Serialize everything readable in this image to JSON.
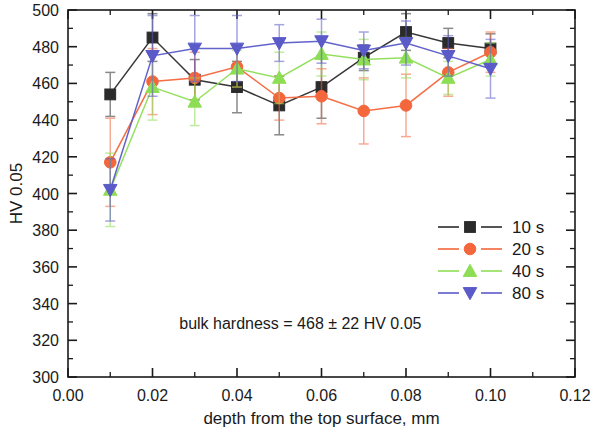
{
  "chart_data": {
    "type": "line",
    "title": "",
    "xlabel": "depth from the top surface, mm",
    "ylabel": "HV 0.05",
    "xlim": [
      0.0,
      0.12
    ],
    "ylim": [
      300,
      500
    ],
    "xticks": [
      0.0,
      0.02,
      0.04,
      0.06,
      0.08,
      0.1,
      0.12
    ],
    "xtick_labels": [
      "0.00",
      "0.02",
      "0.04",
      "0.06",
      "0.08",
      "0.10",
      "0.12"
    ],
    "yticks": [
      300,
      320,
      340,
      360,
      380,
      400,
      420,
      440,
      460,
      480,
      500
    ],
    "ytick_labels": [
      "300",
      "320",
      "340",
      "360",
      "380",
      "400",
      "420",
      "440",
      "460",
      "480",
      "500"
    ],
    "minor_ticks": true,
    "grid": false,
    "legend_position": "right-middle",
    "x": [
      0.01,
      0.02,
      0.03,
      0.04,
      0.05,
      0.06,
      0.07,
      0.08,
      0.09,
      0.1
    ],
    "series": [
      {
        "name": "10 s",
        "label": "10 s",
        "color": "#2b2b2b",
        "marker": "square",
        "values": [
          454,
          485,
          462,
          458,
          448,
          458,
          474,
          488,
          482,
          479
        ],
        "err_plus": [
          12,
          13,
          11,
          14,
          16,
          17,
          7,
          10,
          8,
          8
        ],
        "err_minus": [
          12,
          13,
          11,
          14,
          16,
          17,
          7,
          10,
          8,
          8
        ]
      },
      {
        "name": "20 s",
        "label": "20 s",
        "color": "#f4663c",
        "marker": "circle",
        "values": [
          417,
          461,
          463,
          469,
          452,
          453,
          445,
          448,
          466,
          477
        ],
        "err_plus": [
          24,
          18,
          14,
          11,
          12,
          15,
          18,
          17,
          13,
          11
        ],
        "err_minus": [
          24,
          18,
          14,
          11,
          12,
          15,
          18,
          17,
          13,
          11
        ]
      },
      {
        "name": "40 s",
        "label": "40 s",
        "color": "#8ede55",
        "marker": "triangle-up",
        "values": [
          402,
          458,
          450,
          468,
          463,
          476,
          473,
          474,
          463,
          473
        ],
        "err_plus": [
          20,
          18,
          13,
          10,
          14,
          12,
          11,
          11,
          9,
          9
        ],
        "err_minus": [
          20,
          18,
          13,
          10,
          14,
          12,
          11,
          11,
          9,
          9
        ]
      },
      {
        "name": "80 s",
        "label": "80 s",
        "color": "#5a5ac8",
        "marker": "triangle-down",
        "values": [
          402,
          475,
          479,
          479,
          482,
          483,
          478,
          482,
          475,
          468
        ],
        "err_plus": [
          17,
          22,
          18,
          18,
          10,
          12,
          10,
          12,
          11,
          16
        ],
        "err_minus": [
          17,
          22,
          18,
          18,
          10,
          12,
          10,
          12,
          11,
          16
        ]
      }
    ],
    "annotations": [
      {
        "text": "bulk hardness = 468 ± 22 HV 0.05",
        "x": 0.055,
        "y": 326
      }
    ]
  },
  "legend": {
    "entries": [
      {
        "label": "10 s"
      },
      {
        "label": "20 s"
      },
      {
        "label": "40 s"
      },
      {
        "label": "80 s"
      }
    ]
  }
}
